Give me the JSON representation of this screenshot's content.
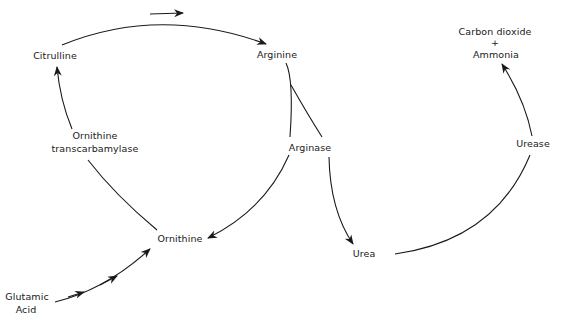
{
  "diagram": {
    "nodes": {
      "citrulline": "Citrulline",
      "arginine": "Arginine",
      "arginase": "Arginase",
      "ornithine": "Ornithine",
      "ornithine_transcarbamylase_1": "Ornithine",
      "ornithine_transcarbamylase_2": "transcarbamylase",
      "glutamic_acid_1": "Glutamic",
      "glutamic_acid_2": "Acid",
      "urea": "Urea",
      "urease": "Urease",
      "products_1": "Carbon dioxide",
      "products_plus": "+",
      "products_2": "Ammonia"
    },
    "edges": [
      {
        "from": "Citrulline",
        "to": "Arginine",
        "arrow": true
      },
      {
        "from": "Arginine",
        "to": "Ornithine",
        "via": "Arginase",
        "arrow": true
      },
      {
        "from": "Arginine",
        "to": "Urea",
        "via": "Arginase",
        "arrow": true
      },
      {
        "from": "Ornithine",
        "to": "Citrulline",
        "via": "Ornithine transcarbamylase",
        "arrow": true
      },
      {
        "from": "Glutamic Acid",
        "to": "Ornithine",
        "arrow": true
      },
      {
        "from": "Urea",
        "to": "Carbon dioxide + Ammonia",
        "via": "Urease",
        "arrow": true
      }
    ],
    "colors": {
      "line": "#1a1a1a",
      "background": "#ffffff"
    }
  }
}
